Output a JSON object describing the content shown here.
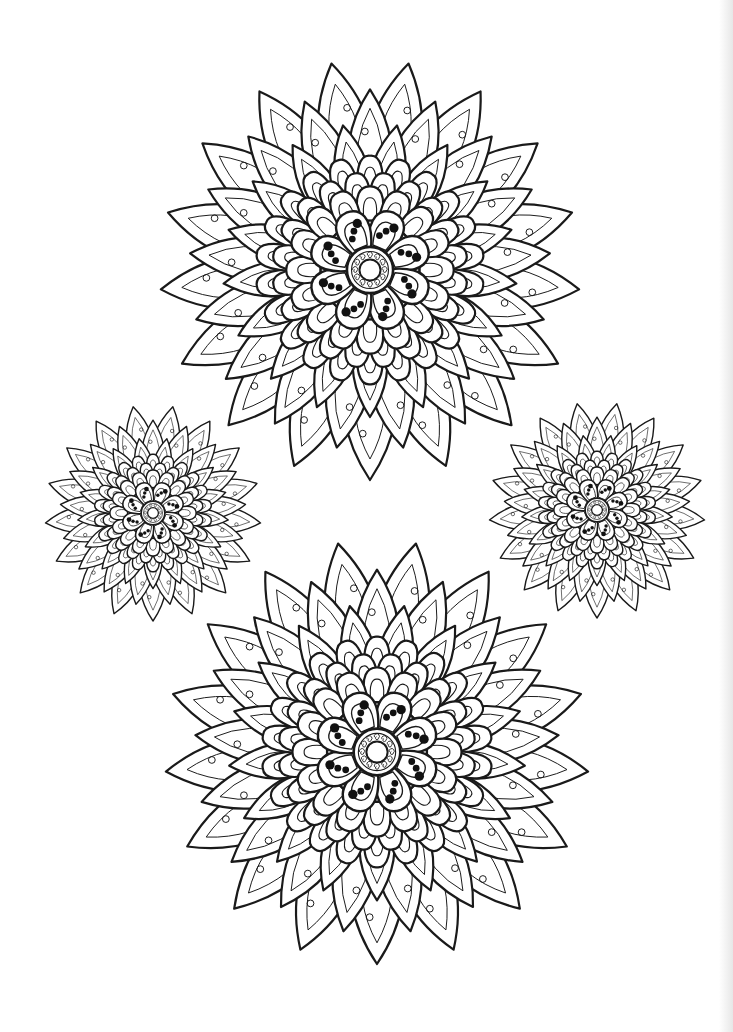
{
  "page": {
    "title": "",
    "background": "#ffffff",
    "ink_color": "#1a1a1a",
    "width": 733,
    "height": 1032
  },
  "flowers": [
    {
      "id": "top-large-mandala",
      "cx": 370,
      "cy": 270,
      "r": 210,
      "outer_petals": 17,
      "scallop_rings": 3,
      "inner_petals": 8,
      "inner_petal_dots": 3,
      "center_spiral_count": 12,
      "stroke": 2.2
    },
    {
      "id": "left-small-mandala",
      "cx": 153,
      "cy": 513,
      "r": 108,
      "outer_petals": 17,
      "scallop_rings": 3,
      "inner_petals": 8,
      "inner_petal_dots": 3,
      "center_spiral_count": 10,
      "stroke": 1.4
    },
    {
      "id": "right-small-mandala",
      "cx": 597,
      "cy": 510,
      "r": 108,
      "outer_petals": 17,
      "scallop_rings": 3,
      "inner_petals": 8,
      "inner_petal_dots": 3,
      "center_spiral_count": 10,
      "stroke": 1.4
    },
    {
      "id": "bottom-large-mandala",
      "cx": 377,
      "cy": 752,
      "r": 212,
      "outer_petals": 17,
      "scallop_rings": 3,
      "inner_petals": 8,
      "inner_petal_dots": 3,
      "center_spiral_count": 12,
      "stroke": 2.2
    }
  ]
}
